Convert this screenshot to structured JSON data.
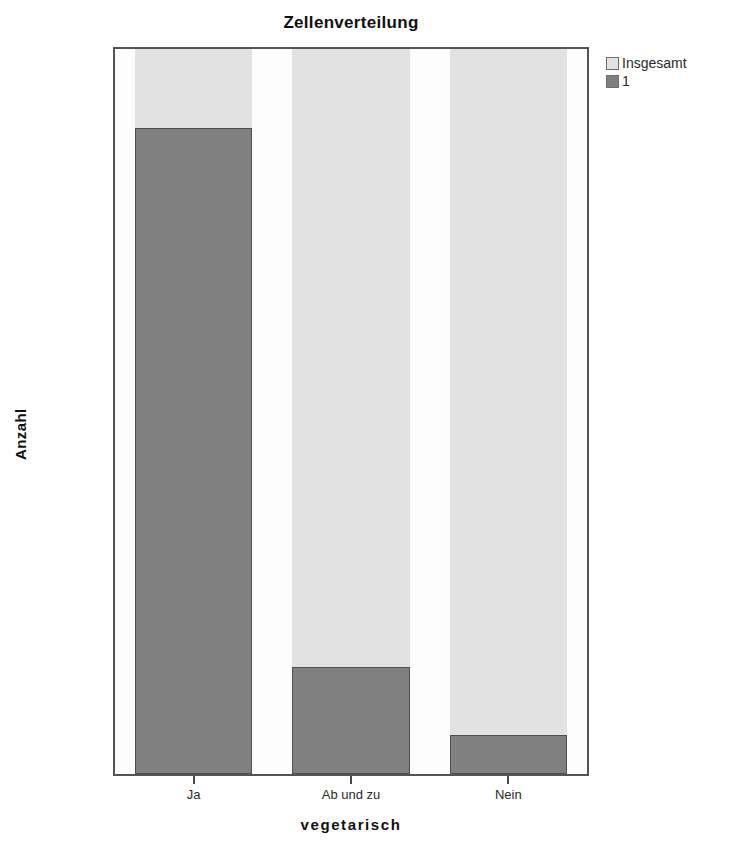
{
  "chart_data": {
    "type": "bar",
    "title": "Zellenverteilung",
    "xlabel": "vegetarisch",
    "ylabel": "Anzahl",
    "categories": [
      "Ja",
      "Ab und zu",
      "Nein"
    ],
    "ytick_labels": [
      "0,0%",
      "20,0%",
      "40,0%",
      "60,0%",
      "80,0%",
      "100,0%"
    ],
    "ytick_values": [
      0,
      20,
      40,
      60,
      80,
      100
    ],
    "ylim": [
      0,
      100
    ],
    "grid": false,
    "legend_position": "top-right",
    "series": [
      {
        "name": "Insgesamt",
        "color": "#e2e2e2",
        "values": [
          100.0,
          100.0,
          100.0
        ]
      },
      {
        "name": "1",
        "color": "#808080",
        "values": [
          89.1,
          14.7,
          5.4
        ]
      }
    ]
  },
  "legend": {
    "items": [
      {
        "label": "Insgesamt",
        "color": "#e2e2e2"
      },
      {
        "label": "1",
        "color": "#808080"
      }
    ]
  },
  "colors": {
    "total_bar": "#e2e2e2",
    "value_bar": "#808080",
    "frame": "#545454",
    "text": "#1a1a1a"
  }
}
